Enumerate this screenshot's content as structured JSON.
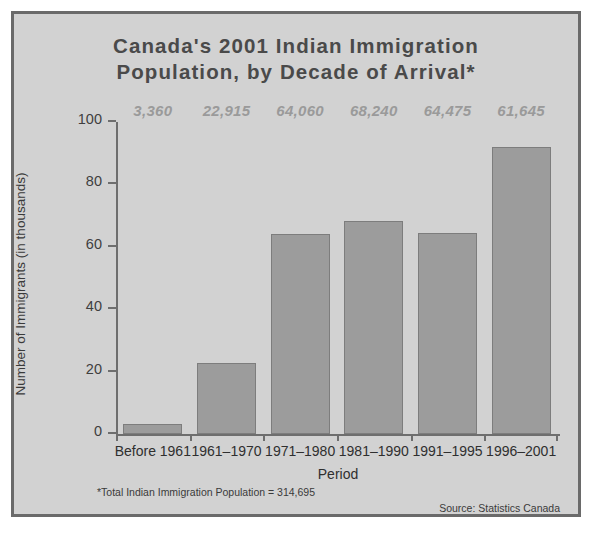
{
  "figure": {
    "title_line_1": "Canada's 2001 Indian Immigration",
    "title_line_2": "Population, by Decade of Arrival*",
    "footnote": "*Total Indian Immigration Population = 314,695",
    "source": "Source: Statistics Canada",
    "frame_color": "#6a6a6a",
    "background_color": "#d2d2d2",
    "bar_color": "#9c9c9c",
    "bar_border_color": "#7d7d7d",
    "label_color": "#9a9a9a",
    "axis_color": "#6e6e6e"
  },
  "chart_data": {
    "type": "bar",
    "title": "Canada's 2001 Indian Immigration Population, by Decade of Arrival*",
    "xlabel": "Period",
    "ylabel": "Number of Immigrants (in thousands)",
    "ylim": [
      0,
      100
    ],
    "yticks": [
      0,
      20,
      40,
      60,
      80,
      100
    ],
    "ytick_labels": [
      "0",
      "20",
      "40",
      "60",
      "80",
      "100"
    ],
    "grid": false,
    "legend": "none",
    "categories": [
      "Before 1961",
      "1961–1970",
      "1971–1980",
      "1981–1990",
      "1991–1995",
      "1996–2001"
    ],
    "values": [
      3.36,
      22.915,
      64.06,
      68.24,
      64.475,
      92.0
    ],
    "data_labels": [
      "3,360",
      "22,915",
      "64,060",
      "68,240",
      "64,475",
      "61,645"
    ],
    "units": "thousands of immigrants",
    "note": "*Total Indian Immigration Population = 314,695",
    "source": "Source: Statistics Canada"
  }
}
